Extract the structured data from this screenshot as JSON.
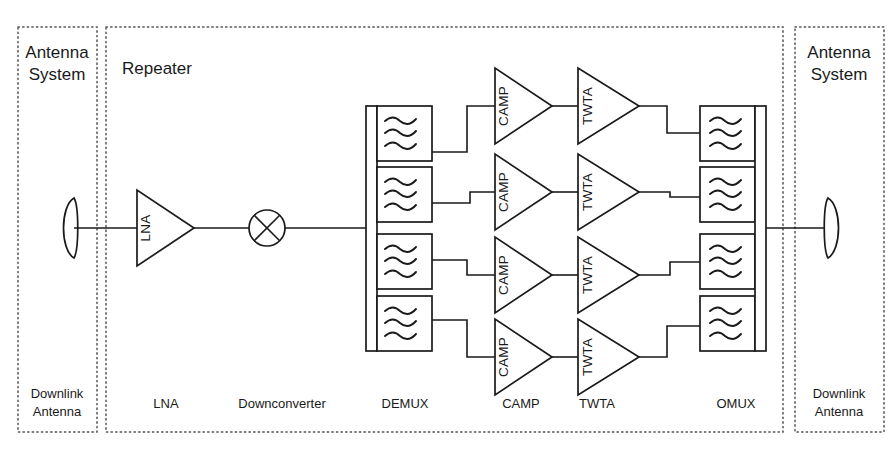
{
  "diagram": {
    "title_hidden": "Satellite transponder repeater block diagram",
    "zones": {
      "left_antenna_system": {
        "line1": "Antenna",
        "line2": "System"
      },
      "repeater": {
        "label": "Repeater"
      },
      "right_antenna_system": {
        "line1": "Antenna",
        "line2": "System"
      }
    },
    "bottom_labels": {
      "left_antenna": {
        "line1": "Downlink",
        "line2": "Antenna"
      },
      "lna": "LNA",
      "downconverter": "Downconverter",
      "demux": "DEMUX",
      "camp": "CAMP",
      "twta": "TWTA",
      "omux": "OMUX",
      "right_antenna": {
        "line1": "Downlink",
        "line2": "Antenna"
      }
    },
    "stages": {
      "lna": {
        "label": "LNA",
        "shape": "triangle-amplifier"
      },
      "mixer": {
        "label": "",
        "shape": "circle-cross-mixer"
      },
      "demux": {
        "label": "DEMUX",
        "shape": "filter-bank",
        "channels": 4
      },
      "camp": {
        "label": "CAMP",
        "shape": "triangle-amplifier",
        "channels": 4
      },
      "twta": {
        "label": "TWTA",
        "shape": "triangle-amplifier",
        "channels": 4
      },
      "omux": {
        "label": "OMUX",
        "shape": "filter-bank",
        "channels": 4
      },
      "antenna_in": {
        "shape": "dish-antenna",
        "facing": "left"
      },
      "antenna_out": {
        "shape": "dish-antenna",
        "facing": "right"
      }
    },
    "channel_labels": {
      "camp": [
        "CAMP",
        "CAMP",
        "CAMP",
        "CAMP"
      ],
      "twta": [
        "TWTA",
        "TWTA",
        "TWTA",
        "TWTA"
      ]
    },
    "colors": {
      "stroke": "#1a1a1a",
      "zone_stroke": "#555555",
      "background": "#ffffff"
    }
  }
}
